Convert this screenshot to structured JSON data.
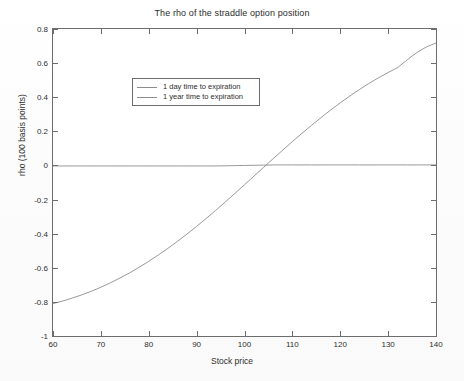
{
  "figure": {
    "title": "The rho of the straddle option position",
    "background_color": "#ffffff",
    "axis_color": "#6d6d6d"
  },
  "legend": {
    "position": "upper-left-inside",
    "entries": [
      {
        "label": "1 day time to expiration",
        "color": "#8c8c8c"
      },
      {
        "label": "1 year time to expiration",
        "color": "#8c8c8c"
      }
    ]
  },
  "axes": {
    "xlabel": "Stock price",
    "ylabel": "rho (100 basis points)",
    "xticklabels": [
      "60",
      "70",
      "80",
      "90",
      "100",
      "110",
      "120",
      "130",
      "140"
    ],
    "yticklabels": [
      "-1",
      "-0.8",
      "-0.6",
      "-0.4",
      "-0.2",
      "0",
      "0.2",
      "0.4",
      "0.6",
      "0.8"
    ]
  },
  "chart_data": {
    "type": "line",
    "title": "The rho of the straddle option position",
    "xlabel": "Stock price",
    "ylabel": "rho (100 basis points)",
    "xlim": [
      60,
      140
    ],
    "ylim": [
      -1,
      0.8
    ],
    "xticks": [
      60,
      70,
      80,
      90,
      100,
      110,
      120,
      130,
      140
    ],
    "yticks": [
      -1,
      -0.8,
      -0.6,
      -0.4,
      -0.2,
      0,
      0.2,
      0.4,
      0.6,
      0.8
    ],
    "grid": false,
    "legend_position": "upper left",
    "x": [
      60,
      62,
      64,
      66,
      68,
      70,
      72,
      74,
      76,
      78,
      80,
      82,
      84,
      86,
      88,
      90,
      92,
      94,
      96,
      98,
      100,
      102,
      104,
      106,
      108,
      110,
      112,
      114,
      116,
      118,
      120,
      122,
      124,
      126,
      128,
      130,
      132,
      134,
      136,
      138,
      140
    ],
    "series": [
      {
        "name": "1 day time to expiration",
        "color": "#8c8c8c",
        "values": [
          -0.003,
          -0.003,
          -0.003,
          -0.003,
          -0.003,
          -0.003,
          -0.003,
          -0.003,
          -0.003,
          -0.003,
          -0.003,
          -0.003,
          -0.003,
          -0.003,
          -0.003,
          -0.003,
          -0.003,
          -0.003,
          -0.002,
          -0.001,
          0.0,
          0.001,
          0.002,
          0.003,
          0.003,
          0.003,
          0.003,
          0.003,
          0.003,
          0.003,
          0.003,
          0.003,
          0.003,
          0.003,
          0.003,
          0.003,
          0.003,
          0.003,
          0.003,
          0.003,
          0.003
        ]
      },
      {
        "name": "1 year time to expiration",
        "color": "#8c8c8c",
        "values": [
          -0.81,
          -0.795,
          -0.778,
          -0.759,
          -0.738,
          -0.714,
          -0.688,
          -0.66,
          -0.63,
          -0.597,
          -0.562,
          -0.525,
          -0.486,
          -0.445,
          -0.402,
          -0.357,
          -0.311,
          -0.263,
          -0.214,
          -0.164,
          -0.113,
          -0.062,
          -0.011,
          0.04,
          0.09,
          0.14,
          0.188,
          0.235,
          0.281,
          0.325,
          0.367,
          0.407,
          0.445,
          0.481,
          0.514,
          0.545,
          0.574,
          0.62,
          0.662,
          0.695,
          0.718
        ]
      }
    ],
    "zero_crossing_x": 104.4
  }
}
